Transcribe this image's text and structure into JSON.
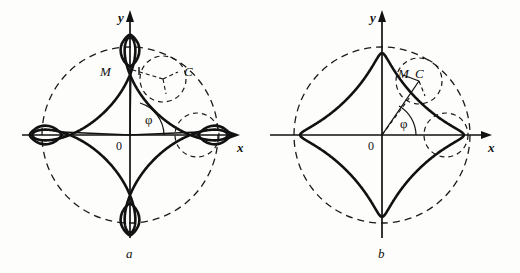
{
  "figure": {
    "stroke_color": "#111111",
    "background_color": "#fdfdfb"
  },
  "panels": [
    {
      "id": "a",
      "caption": "a",
      "curve_kind": "prolate hypocycloid (looped)",
      "axis_labels": {
        "x": "x",
        "y": "y"
      },
      "origin_label": "0",
      "angle_label": "φ",
      "point_labels": {
        "moving_point": "M",
        "circle_center": "C"
      }
    },
    {
      "id": "b",
      "caption": "b",
      "curve_kind": "curtate hypocycloid (smooth)",
      "axis_labels": {
        "x": "x",
        "y": "y"
      },
      "origin_label": "0",
      "angle_label": "φ",
      "point_labels": {
        "moving_point": "M",
        "circle_center": "C"
      }
    }
  ],
  "chart_data": {
    "type": "line",
    "xlabel": "x",
    "ylabel": "y",
    "grid": false,
    "legend": null,
    "series": [
      {
        "name": "panel-a prolate hypocycloid",
        "parametric": "x = (R-r)cos t + d cos((R-r)/r t),  y = (R-r)sin t - d sin((R-r)/r t)",
        "R": 1.0,
        "r": 0.25,
        "d": 0.36,
        "loops": 4,
        "cusp_directions_deg": [
          0,
          90,
          180,
          270
        ]
      },
      {
        "name": "panel-b curtate hypocycloid",
        "parametric": "x = (R-r)cos t + d cos((R-r)/r t),  y = (R-r)sin t - d sin((R-r)/r t)",
        "R": 1.0,
        "r": 0.25,
        "d": 0.18,
        "loops": 0,
        "cusp_directions_deg": [
          0,
          90,
          180,
          270
        ]
      }
    ],
    "guides": [
      {
        "name": "fixed directrix circle",
        "style": "dashed",
        "radius": 1.0
      },
      {
        "name": "rolling circle at angle phi",
        "style": "dashed",
        "radius": 0.25
      },
      {
        "name": "rolling circle on x-axis",
        "style": "dashed",
        "radius": 0.25
      }
    ]
  }
}
